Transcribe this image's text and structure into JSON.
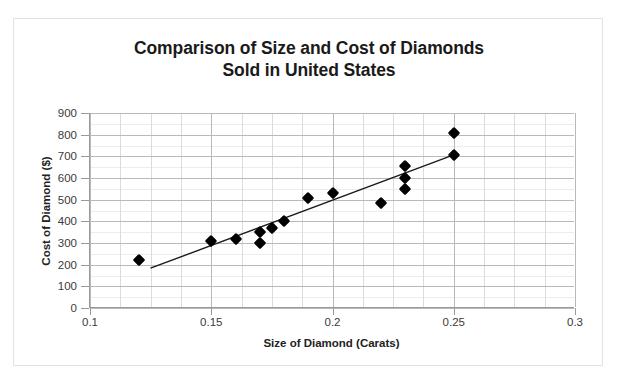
{
  "chart_data": {
    "type": "scatter",
    "title": "Comparison of Size and Cost of Diamonds Sold in United States",
    "title_line1": "Comparison of Size and Cost of Diamonds",
    "title_line2": "Sold in United States",
    "xlabel": "Size of Diamond (Carats)",
    "ylabel": "Cost of Diamond ($)",
    "xlim": [
      0.1,
      0.3
    ],
    "ylim": [
      0,
      900
    ],
    "xticks": [
      0.1,
      0.15,
      0.2,
      0.25,
      0.3
    ],
    "xtick_labels": [
      "0.1",
      "0.15",
      "0.2",
      "0.25",
      "0.3"
    ],
    "yticks": [
      0,
      100,
      200,
      300,
      400,
      500,
      600,
      700,
      800,
      900
    ],
    "ytick_labels": [
      "0",
      "100",
      "200",
      "300",
      "400",
      "500",
      "600",
      "700",
      "800",
      "900"
    ],
    "grid": true,
    "grid_minor": true,
    "legend": false,
    "marker_shape": "diamond",
    "marker_color": "#000000",
    "x": [
      0.12,
      0.15,
      0.16,
      0.17,
      0.17,
      0.175,
      0.18,
      0.19,
      0.2,
      0.22,
      0.23,
      0.23,
      0.23,
      0.25,
      0.25
    ],
    "y": [
      220,
      310,
      320,
      350,
      300,
      370,
      400,
      510,
      530,
      485,
      655,
      600,
      550,
      810,
      705
    ],
    "points": [
      {
        "x": 0.12,
        "y": 220
      },
      {
        "x": 0.15,
        "y": 310
      },
      {
        "x": 0.16,
        "y": 320
      },
      {
        "x": 0.17,
        "y": 350
      },
      {
        "x": 0.17,
        "y": 300
      },
      {
        "x": 0.175,
        "y": 370
      },
      {
        "x": 0.18,
        "y": 400
      },
      {
        "x": 0.19,
        "y": 510
      },
      {
        "x": 0.2,
        "y": 530
      },
      {
        "x": 0.22,
        "y": 485
      },
      {
        "x": 0.23,
        "y": 655
      },
      {
        "x": 0.23,
        "y": 600
      },
      {
        "x": 0.23,
        "y": 550
      },
      {
        "x": 0.25,
        "y": 810
      },
      {
        "x": 0.25,
        "y": 705
      }
    ],
    "trendline": {
      "visible": true,
      "color": "#1a1a1a",
      "x_start": 0.125,
      "y_start": 180,
      "x_end": 0.25,
      "y_end": 705
    }
  },
  "colors": {
    "marker": "#000000",
    "trendline": "#1a1a1a",
    "gridline_major": "#b9b9b9",
    "gridline_minor": "#ececec",
    "axis": "#9a9a9a",
    "frame": "#e2e2e2",
    "text": "#222222",
    "background": "#ffffff"
  }
}
